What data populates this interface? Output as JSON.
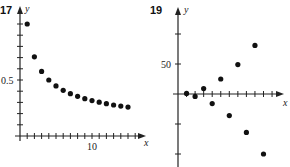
{
  "figures": [
    {
      "number": "17",
      "x_label": "x",
      "y_label": "y",
      "y_tick_label": "0.5",
      "x_tick_label": "10"
    },
    {
      "number": "19",
      "x_label": "x",
      "y_label": "y",
      "y_tick_label": "50"
    }
  ],
  "chart_data": [
    {
      "type": "scatter",
      "title": "17",
      "xlabel": "x",
      "ylabel": "y",
      "x": [
        1,
        2,
        3,
        4,
        5,
        6,
        7,
        8,
        9,
        10,
        11,
        12,
        13,
        14,
        15
      ],
      "values": [
        1.0,
        0.707,
        0.577,
        0.5,
        0.447,
        0.408,
        0.378,
        0.354,
        0.333,
        0.316,
        0.302,
        0.289,
        0.277,
        0.267,
        0.258
      ],
      "x_ticks": [
        1,
        2,
        3,
        4,
        5,
        6,
        7,
        8,
        9,
        10,
        11,
        12,
        13,
        14,
        15,
        16
      ],
      "x_tick_labels": {
        "10": "10"
      },
      "y_ticks": [
        0.1,
        0.2,
        0.3,
        0.4,
        0.5,
        0.6,
        0.7,
        0.8,
        0.9,
        1.0
      ],
      "y_tick_labels": {
        "0.5": "0.5"
      },
      "xlim": [
        0,
        16
      ],
      "ylim": [
        0,
        1.05
      ],
      "grid": false
    },
    {
      "type": "scatter",
      "title": "19",
      "xlabel": "x",
      "ylabel": "y",
      "x": [
        1,
        2,
        3,
        4,
        5,
        6,
        7,
        8,
        9,
        10
      ],
      "values": [
        1,
        -4,
        9,
        -16,
        25,
        -36,
        49,
        -64,
        81,
        -100
      ],
      "x_ticks": [
        1,
        2,
        3,
        4,
        5,
        6,
        7,
        8,
        9,
        10,
        11
      ],
      "y_ticks": [
        -100,
        -50,
        50,
        100
      ],
      "y_tick_labels": {
        "50": "50"
      },
      "xlim": [
        0,
        11.5
      ],
      "ylim": [
        -110,
        110
      ],
      "grid": false
    }
  ]
}
